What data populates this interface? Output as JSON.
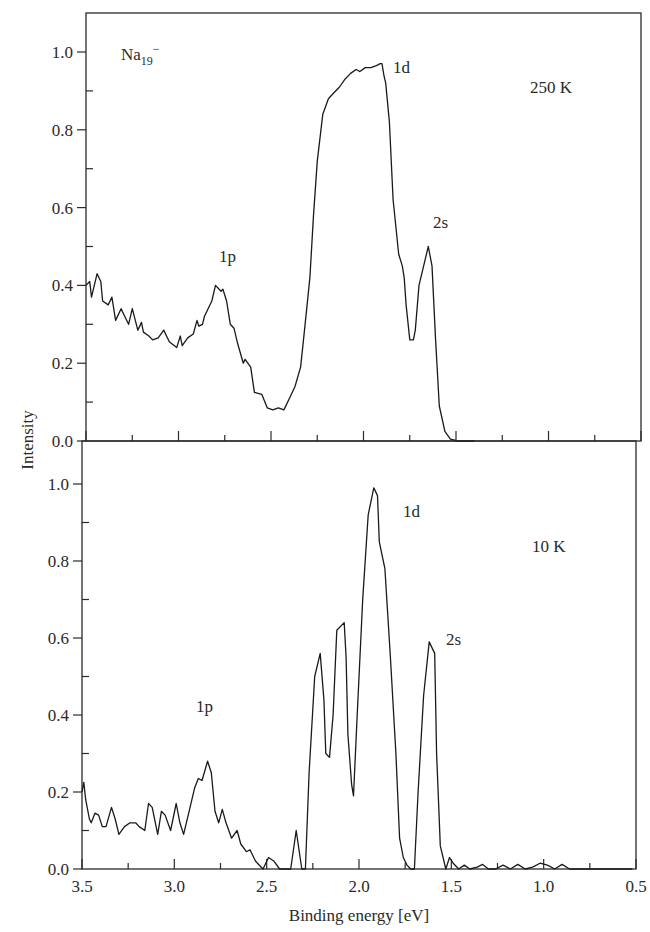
{
  "chart_data": [
    {
      "type": "line",
      "panel": "top",
      "title": "",
      "species_label": "Na19-",
      "species_base": "Na",
      "species_sub": "19",
      "species_sup": "−",
      "temperature_label": "250 K",
      "xlabel": "",
      "ylabel": "Intensity",
      "xlim": [
        3.5,
        0.5
      ],
      "ylim": [
        0.0,
        1.1
      ],
      "x_reversed": true,
      "yticks": [
        0.0,
        0.2,
        0.4,
        0.6,
        0.8,
        1.0
      ],
      "ytick_labels": [
        "0.0",
        "0.2",
        "0.4",
        "0.6",
        "0.8",
        "1.0"
      ],
      "grid": false,
      "annotations": [
        {
          "text": "1p",
          "x": 2.78,
          "y": 0.45
        },
        {
          "text": "1d",
          "x": 1.84,
          "y": 0.98
        },
        {
          "text": "2s",
          "x": 1.6,
          "y": 0.56
        }
      ],
      "series": [
        {
          "name": "250 K",
          "x": [
            3.5,
            3.48,
            3.47,
            3.44,
            3.42,
            3.41,
            3.38,
            3.36,
            3.34,
            3.31,
            3.29,
            3.27,
            3.25,
            3.22,
            3.2,
            3.19,
            3.16,
            3.14,
            3.11,
            3.08,
            3.05,
            3.01,
            2.99,
            2.98,
            2.95,
            2.92,
            2.9,
            2.89,
            2.87,
            2.86,
            2.84,
            2.82,
            2.8,
            2.77,
            2.76,
            2.74,
            2.72,
            2.7,
            2.68,
            2.65,
            2.64,
            2.61,
            2.59,
            2.55,
            2.52,
            2.49,
            2.46,
            2.43,
            2.4,
            2.37,
            2.34,
            2.32,
            2.29,
            2.27,
            2.25,
            2.22,
            2.19,
            2.16,
            2.13,
            2.1,
            2.07,
            2.04,
            2.02,
            1.99,
            1.96,
            1.93,
            1.91,
            1.9,
            1.89,
            1.88,
            1.86,
            1.84,
            1.81,
            1.79,
            1.78,
            1.77,
            1.75,
            1.73,
            1.72,
            1.7,
            1.68,
            1.65,
            1.63,
            1.61,
            1.59,
            1.56,
            1.53,
            1.49,
            1.46,
            1.43,
            1.4
          ],
          "y": [
            0.4,
            0.41,
            0.37,
            0.43,
            0.41,
            0.36,
            0.35,
            0.37,
            0.31,
            0.34,
            0.32,
            0.3,
            0.34,
            0.285,
            0.305,
            0.28,
            0.27,
            0.26,
            0.265,
            0.285,
            0.255,
            0.24,
            0.27,
            0.245,
            0.265,
            0.275,
            0.31,
            0.295,
            0.3,
            0.32,
            0.34,
            0.36,
            0.4,
            0.385,
            0.39,
            0.36,
            0.3,
            0.29,
            0.25,
            0.2,
            0.21,
            0.19,
            0.125,
            0.12,
            0.085,
            0.08,
            0.085,
            0.08,
            0.11,
            0.14,
            0.19,
            0.28,
            0.42,
            0.58,
            0.72,
            0.84,
            0.88,
            0.895,
            0.91,
            0.93,
            0.945,
            0.955,
            0.95,
            0.96,
            0.96,
            0.965,
            0.97,
            0.97,
            0.94,
            0.92,
            0.82,
            0.62,
            0.48,
            0.45,
            0.42,
            0.35,
            0.26,
            0.26,
            0.285,
            0.4,
            0.44,
            0.5,
            0.45,
            0.26,
            0.09,
            0.025,
            0.005,
            0.0,
            0.0,
            0.0,
            0.0
          ]
        }
      ]
    },
    {
      "type": "line",
      "panel": "bottom",
      "title": "",
      "temperature_label": "10 K",
      "xlabel": "Binding energy [eV]",
      "ylabel": "Intensity",
      "xlim": [
        3.5,
        0.5
      ],
      "ylim": [
        0.0,
        1.1
      ],
      "x_reversed": true,
      "xticks": [
        3.5,
        3.0,
        2.5,
        2.0,
        1.5,
        1.0,
        0.5
      ],
      "xtick_labels": [
        "3.5",
        "3.0",
        "2.5",
        "2.0",
        "1.5",
        "1.0",
        "0.5"
      ],
      "yticks": [
        0.0,
        0.2,
        0.4,
        0.6,
        0.8,
        1.0
      ],
      "ytick_labels": [
        "0.0",
        "0.2",
        "0.4",
        "0.6",
        "0.8",
        "1.0"
      ],
      "grid": false,
      "annotations": [
        {
          "text": "1p",
          "x": 2.82,
          "y": 0.36
        },
        {
          "text": "1d",
          "x": 1.84,
          "y": 0.89
        },
        {
          "text": "2s",
          "x": 1.53,
          "y": 0.56
        }
      ],
      "series": [
        {
          "name": "10 K",
          "x": [
            3.5,
            3.49,
            3.48,
            3.46,
            3.45,
            3.43,
            3.41,
            3.39,
            3.37,
            3.34,
            3.32,
            3.3,
            3.27,
            3.24,
            3.21,
            3.19,
            3.16,
            3.14,
            3.12,
            3.09,
            3.07,
            3.05,
            3.02,
            2.99,
            2.97,
            2.95,
            2.92,
            2.89,
            2.87,
            2.85,
            2.82,
            2.8,
            2.78,
            2.76,
            2.74,
            2.72,
            2.69,
            2.66,
            2.64,
            2.61,
            2.59,
            2.56,
            2.52,
            2.49,
            2.46,
            2.43,
            2.4,
            2.37,
            2.34,
            2.31,
            2.29,
            2.27,
            2.24,
            2.21,
            2.19,
            2.18,
            2.16,
            2.14,
            2.12,
            2.08,
            2.07,
            2.06,
            2.04,
            2.03,
            2.01,
            1.98,
            1.95,
            1.92,
            1.9,
            1.89,
            1.86,
            1.83,
            1.8,
            1.78,
            1.76,
            1.74,
            1.72,
            1.7,
            1.68,
            1.65,
            1.62,
            1.59,
            1.58,
            1.56,
            1.53,
            1.51,
            1.49,
            1.46,
            1.43,
            1.4,
            1.36,
            1.33,
            1.3,
            1.26,
            1.22,
            1.18,
            1.14,
            1.1,
            1.06,
            1.02,
            0.98,
            0.94,
            0.9,
            0.86,
            0.82,
            0.78,
            0.74,
            0.7,
            0.66,
            0.62,
            0.58,
            0.55,
            0.52
          ],
          "y": [
            0.2,
            0.225,
            0.18,
            0.13,
            0.12,
            0.145,
            0.14,
            0.11,
            0.11,
            0.16,
            0.13,
            0.09,
            0.11,
            0.12,
            0.12,
            0.11,
            0.1,
            0.17,
            0.16,
            0.09,
            0.15,
            0.14,
            0.1,
            0.17,
            0.12,
            0.09,
            0.15,
            0.21,
            0.235,
            0.23,
            0.28,
            0.25,
            0.15,
            0.12,
            0.155,
            0.12,
            0.08,
            0.1,
            0.065,
            0.045,
            0.05,
            0.02,
            0.0,
            0.03,
            0.02,
            0.0,
            0.0,
            0.0,
            0.1,
            0.0,
            0.0,
            0.25,
            0.5,
            0.56,
            0.44,
            0.3,
            0.29,
            0.4,
            0.62,
            0.64,
            0.55,
            0.35,
            0.22,
            0.19,
            0.4,
            0.7,
            0.92,
            0.99,
            0.97,
            0.85,
            0.78,
            0.55,
            0.3,
            0.08,
            0.03,
            0.01,
            0.0,
            0.0,
            0.2,
            0.45,
            0.59,
            0.56,
            0.3,
            0.06,
            0.0,
            0.03,
            0.015,
            0.0,
            0.01,
            0.0,
            0.005,
            0.012,
            0.0,
            0.0,
            0.01,
            0.0,
            0.012,
            0.0,
            0.005,
            0.015,
            0.01,
            0.0,
            0.012,
            0.0,
            0.0,
            0.0,
            0.0,
            0.0,
            0.0,
            0.0,
            0.0,
            0.0,
            0.0
          ]
        }
      ]
    }
  ],
  "figure": {
    "ylabel": "Intensity",
    "xlabel": "Binding energy [eV]",
    "top_species_base": "Na",
    "top_species_sub": "19",
    "top_species_sup": "−",
    "top_temp": "250 K",
    "bottom_temp": "10 K",
    "top_labels": {
      "p": "1p",
      "d": "1d",
      "s": "2s"
    },
    "bottom_labels": {
      "p": "1p",
      "d": "1d",
      "s": "2s"
    }
  }
}
